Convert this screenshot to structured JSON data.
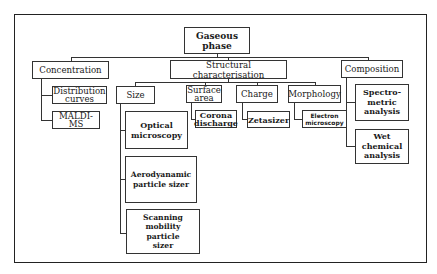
{
  "diagram": {
    "root": "Gaseous\nphase",
    "categories": [
      {
        "label": "Concentration",
        "children": [
          "Distribution curves",
          "MALDI-MS"
        ]
      },
      {
        "label": "Structural characterisation",
        "children": [
          {
            "label": "Size",
            "children": [
              "Optical microscopy",
              "Aerodyanamic particle sizer",
              "Scanning mobility particle sizer"
            ]
          },
          {
            "label": "Surface area",
            "children": [
              "Corona discharge"
            ]
          },
          {
            "label": "Charge",
            "children": [
              "Zetasizer"
            ]
          },
          {
            "label": "Morphology",
            "children": [
              "Electron microscopy"
            ]
          }
        ]
      },
      {
        "label": "Composition",
        "children": [
          "Spectro-metric analysis",
          "Wet chemical analysis"
        ]
      }
    ]
  },
  "labels": {
    "root_l1": "Gaseous",
    "root_l2": "phase",
    "concentration": "Concentration",
    "distribution_l1": "Distribution",
    "distribution_l2": "curves",
    "maldi_l1": "MALDI-",
    "maldi_l2": "MS",
    "structural": "Structural characterisation",
    "size": "Size",
    "optical_l1": "Optical",
    "optical_l2": "microscopy",
    "aero_l1": "Aerodyanamic",
    "aero_l2": "particle sizer",
    "scanning_l1": "Scanning",
    "scanning_l2": "mobility particle",
    "scanning_l3": "sizer",
    "surface_l1": "Surface",
    "surface_l2": "area",
    "corona_l1": "Corona",
    "corona_l2": "discharge",
    "charge": "Charge",
    "zetasizer": "Zetasizer",
    "morphology": "Morphology",
    "electron_l1": "Electron",
    "electron_l2": "microscopy",
    "composition": "Composition",
    "spectro_l1": "Spectro-",
    "spectro_l2": "metric",
    "spectro_l3": "analysis",
    "wet_l1": "Wet",
    "wet_l2": "chemical",
    "wet_l3": "analysis"
  }
}
